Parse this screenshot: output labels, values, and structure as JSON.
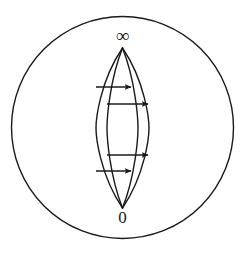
{
  "figure": {
    "type": "diagram",
    "kind": "riemann-sphere-flow-diagram",
    "title": "",
    "background_color": "#ffffff",
    "stroke_color": "#1a1a1a",
    "canvas": {
      "width": 245,
      "height": 257
    },
    "labels": {
      "top": "∞",
      "bottom": "0"
    },
    "boundary_circle": {
      "name": "outer-circle",
      "cx": 122.5,
      "cy": 127.5,
      "r": 111,
      "stroke_width": 1.4,
      "fill": "none"
    },
    "poles": {
      "top_vertex": {
        "x": 122.5,
        "y": 48
      },
      "bottom_vertex": {
        "x": 122.5,
        "y": 208
      }
    },
    "lens_arcs": [
      {
        "name": "arc-outer-left",
        "half_width": 26.5,
        "side": "left"
      },
      {
        "name": "arc-inner-left",
        "half_width": 15.5,
        "side": "left"
      },
      {
        "name": "arc-inner-right",
        "half_width": 15.5,
        "side": "right"
      },
      {
        "name": "arc-outer-right",
        "half_width": 26.5,
        "side": "right"
      }
    ],
    "flow_arrows": [
      {
        "name": "flow-arrow-1",
        "y": 87,
        "x_start": 96,
        "x_end": 131,
        "direction": "right"
      },
      {
        "name": "flow-arrow-2",
        "y": 104,
        "x_start": 107,
        "x_end": 148,
        "direction": "right"
      },
      {
        "name": "flow-arrow-3",
        "y": 155,
        "x_start": 107,
        "x_end": 148,
        "direction": "right"
      },
      {
        "name": "flow-arrow-4",
        "y": 171,
        "x_start": 96,
        "x_end": 131,
        "direction": "right"
      }
    ]
  }
}
